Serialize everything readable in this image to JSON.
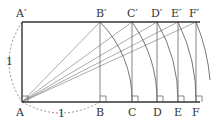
{
  "diagram": {
    "top_labels": [
      "A′",
      "B′",
      "C′",
      "D′",
      "E′",
      "F′"
    ],
    "bottom_labels": [
      "A",
      "B",
      "C",
      "D",
      "E",
      "F"
    ],
    "side_length_label": "1",
    "base_length_label": "1",
    "colors": {
      "frame": "#333333",
      "rays": "#888888",
      "arcs": "#555555",
      "dashed": "#777777"
    }
  }
}
